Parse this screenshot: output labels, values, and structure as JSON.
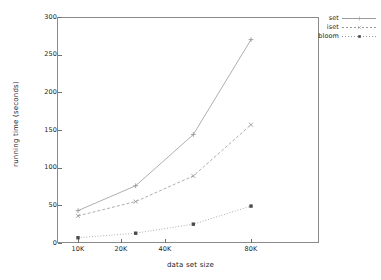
{
  "chart_data": {
    "type": "line",
    "title": "",
    "xlabel": "data set size",
    "ylabel": "running time (seconds)",
    "categories": [
      "10K",
      "20K",
      "40K",
      "80K"
    ],
    "x_numeric": [
      10000,
      20000,
      40000,
      80000
    ],
    "x_scale": "log",
    "ylim": [
      0,
      300
    ],
    "ytick_labels": [
      "0",
      "50",
      "100",
      "150",
      "200",
      "250",
      "300"
    ],
    "ytick_values": [
      0,
      50,
      100,
      150,
      200,
      250,
      300
    ],
    "grid": false,
    "legend_position": "top-right",
    "series": [
      {
        "name": "set",
        "values": [
          43,
          76,
          144,
          270
        ],
        "marker": "plus",
        "line": "solid"
      },
      {
        "name": "iset",
        "values": [
          36,
          55,
          89,
          157
        ],
        "marker": "cross",
        "line": "dashed"
      },
      {
        "name": "bloom",
        "values": [
          7,
          13,
          25,
          49
        ],
        "marker": "square",
        "line": "dotted"
      }
    ]
  },
  "axis": {
    "y_title": "running time (seconds)",
    "x_title": "data set size"
  },
  "legend": {
    "items": [
      {
        "label": "set"
      },
      {
        "label": "iset"
      },
      {
        "label": "bloom"
      }
    ]
  },
  "colors": {
    "line": "#9a9a9a",
    "axis": "#8a8a8a",
    "text": "#1a1a1a",
    "background": "#ffffff"
  }
}
